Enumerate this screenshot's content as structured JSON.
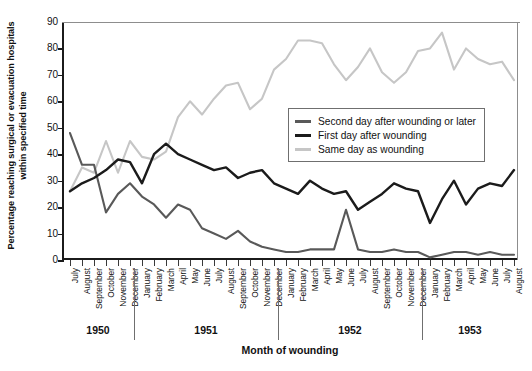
{
  "chart_data": {
    "type": "line",
    "title": "",
    "xlabel": "Month of wounding",
    "ylabel": "Percentage reaching surgical or evacuation hospitals within specified time",
    "ylim": [
      0,
      90
    ],
    "yticks": [
      0,
      10,
      20,
      30,
      40,
      50,
      60,
      70,
      80,
      90
    ],
    "grid": false,
    "legend_position": "center-right",
    "categories": [
      "July",
      "August",
      "September",
      "October",
      "November",
      "December",
      "January",
      "February",
      "March",
      "April",
      "May",
      "June",
      "July",
      "August",
      "September",
      "October",
      "November",
      "December",
      "January",
      "February",
      "March",
      "April",
      "May",
      "June",
      "July",
      "August",
      "September",
      "October",
      "November",
      "December",
      "January",
      "February",
      "March",
      "April",
      "May",
      "June",
      "July",
      "August"
    ],
    "year_groups": [
      {
        "label": "1950",
        "start_index": 0,
        "count": 6
      },
      {
        "label": "1951",
        "start_index": 6,
        "count": 12
      },
      {
        "label": "1952",
        "start_index": 18,
        "count": 12
      },
      {
        "label": "1953",
        "start_index": 30,
        "count": 8
      }
    ],
    "series": [
      {
        "name": "Second day after wounding or later",
        "color": "#595959",
        "values": [
          48,
          36,
          36,
          18,
          25,
          29,
          24,
          21,
          16,
          21,
          19,
          12,
          10,
          8,
          11,
          7,
          5,
          4,
          3,
          3,
          4,
          4,
          4,
          19,
          4,
          3,
          3,
          4,
          3,
          3,
          1,
          2,
          3,
          3,
          2,
          3,
          2,
          2
        ]
      },
      {
        "name": "First day after wounding",
        "color": "#1b1b1b",
        "values": [
          26,
          29,
          31,
          34,
          38,
          37,
          29,
          40,
          44,
          40,
          38,
          36,
          34,
          35,
          31,
          33,
          34,
          29,
          27,
          25,
          30,
          27,
          25,
          26,
          19,
          22,
          25,
          29,
          27,
          26,
          14,
          23,
          30,
          21,
          27,
          29,
          28,
          34
        ]
      },
      {
        "name": "Same day as wounding",
        "color": "#c6c6c6",
        "values": [
          26,
          35,
          33,
          45,
          33,
          45,
          39,
          38,
          41,
          54,
          60,
          55,
          61,
          66,
          67,
          57,
          61,
          72,
          76,
          83,
          83,
          82,
          74,
          68,
          73,
          80,
          71,
          67,
          71,
          79,
          80,
          86,
          72,
          80,
          76,
          74,
          75,
          68
        ]
      }
    ]
  }
}
